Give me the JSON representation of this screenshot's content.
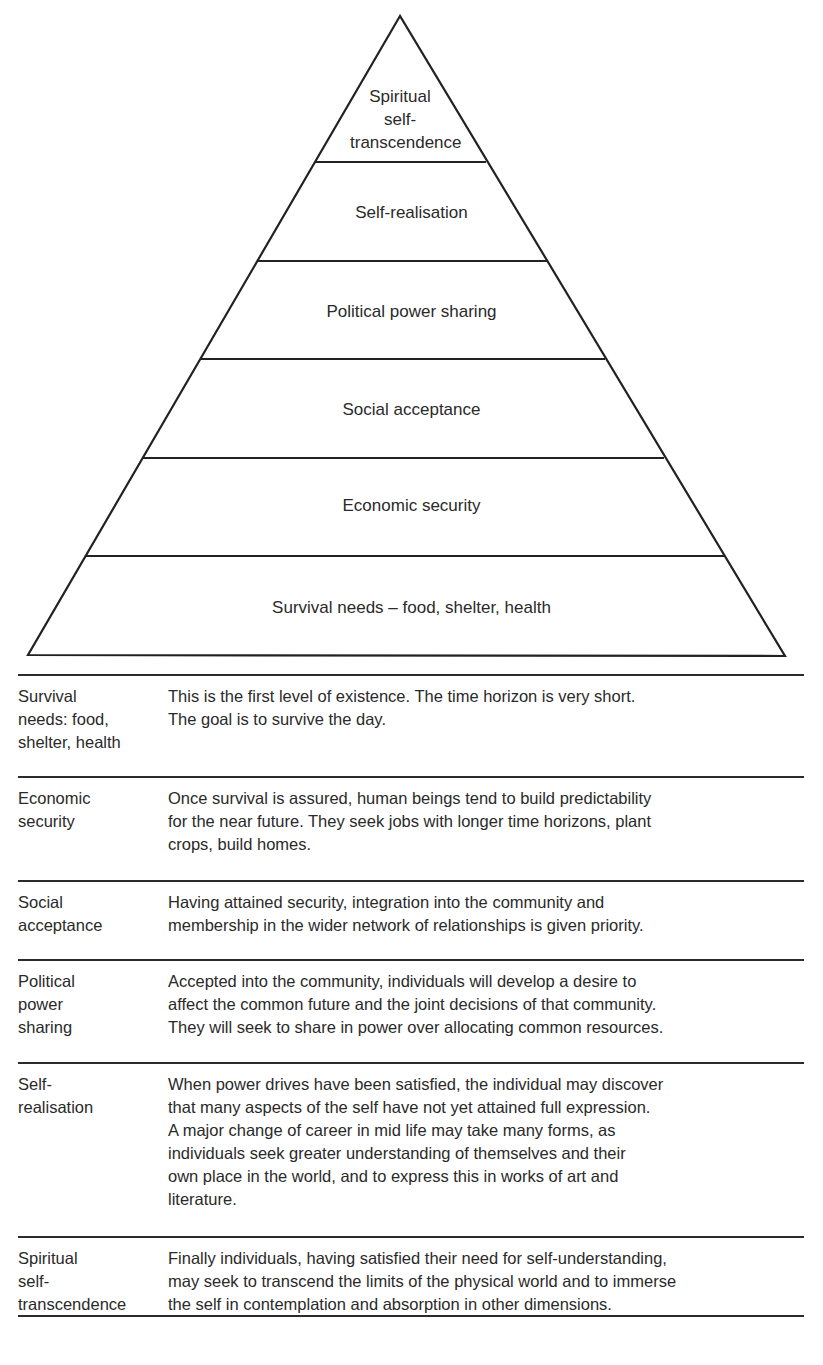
{
  "pyramid": {
    "levels": [
      {
        "label": "Spiritual\nself-\ntranscendence"
      },
      {
        "label": "Self-realisation"
      },
      {
        "label": "Political power sharing"
      },
      {
        "label": "Social acceptance"
      },
      {
        "label": "Economic security"
      },
      {
        "label": "Survival needs – food, shelter, health"
      }
    ],
    "line_color": "#222222"
  },
  "table": {
    "rows": [
      {
        "label": "Survival\nneeds: food,\nshelter, health",
        "description": "This is the first level of existence.  The time horizon is very short.\nThe goal is to survive the day."
      },
      {
        "label": "Economic\nsecurity",
        "description": "Once survival is assured, human beings tend to build predictability\nfor the near future.  They seek jobs with longer time horizons, plant\ncrops, build homes."
      },
      {
        "label": "Social\nacceptance",
        "description": "Having attained security, integration into the community and\nmembership in the wider network of relationships is given priority."
      },
      {
        "label": "Political\npower\nsharing",
        "description": "Accepted into the community, individuals will develop a desire to\naffect the common future and the joint decisions of that community.\nThey will seek to share in power over allocating common resources."
      },
      {
        "label": "Self-\nrealisation",
        "description": "When power drives have been satisfied, the individual may discover\nthat many aspects of the self have not yet attained full expression.\nA major change of career in mid life may take many forms, as\nindividuals seek greater understanding of themselves and their\nown place in the world, and to express this in works of art and\nliterature."
      },
      {
        "label": "Spiritual\nself-\ntranscendence",
        "description": "Finally individuals, having satisfied their need for self-understanding,\nmay seek to transcend the limits of the physical world and to immerse\nthe self in contemplation and absorption in other dimensions."
      }
    ]
  }
}
